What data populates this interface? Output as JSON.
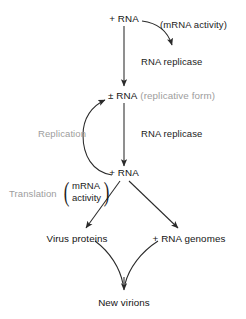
{
  "diagram": {
    "colors": {
      "text": "#1b1b1b",
      "muted": "#9d9d9d",
      "arrow": "#2a2a2a",
      "background": "#ffffff"
    },
    "nodes": {
      "top_rna": "+ RNA",
      "replicative_form_main": "± RNA",
      "replicative_form_note": "(replicative form)",
      "mid_rna": "+ RNA",
      "virus_proteins": "Virus proteins",
      "rna_genomes": "+ RNA genomes",
      "new_virions": "New virions"
    },
    "edge_labels": {
      "mrna_activity_top": "(mRNA activity)",
      "rna_replicase_1": "RNA replicase",
      "rna_replicase_2": "RNA replicase",
      "replication": "Replication",
      "translation": "Translation",
      "mrna_activity_line1": "mRNA",
      "mrna_activity_line2": "activity"
    },
    "icons": {
      "arrowhead": "arrowhead-icon"
    }
  }
}
